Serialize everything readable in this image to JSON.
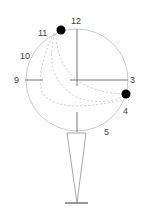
{
  "diagram": {
    "labels": {
      "h12": "12",
      "h3": "3",
      "h4": "4",
      "h5": "5",
      "h9": "9",
      "h10": "10",
      "h11": "11"
    },
    "colors": {
      "circle": "#cccccc",
      "axis": "#777777",
      "dashed": "#cccccc",
      "dot": "#000000",
      "stand": "#aaaaaa",
      "base": "#555555"
    }
  }
}
